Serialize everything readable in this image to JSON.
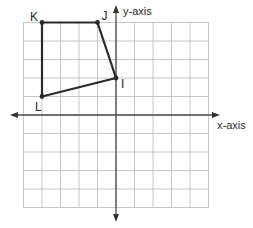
{
  "diagram": {
    "type": "coordinate-plane",
    "grid": {
      "x_min": -5,
      "x_max": 5,
      "y_min": -5,
      "y_max": 5,
      "step": 1
    },
    "axes": {
      "x_label": "x-axis",
      "y_label": "y-axis"
    },
    "polygon": {
      "vertices": [
        {
          "name": "K",
          "x": -4,
          "y": 5
        },
        {
          "name": "J",
          "x": -1,
          "y": 5
        },
        {
          "name": "I",
          "x": 0,
          "y": 2
        },
        {
          "name": "L",
          "x": -4,
          "y": 1
        }
      ],
      "edges": [
        [
          "K",
          "J"
        ],
        [
          "J",
          "I"
        ],
        [
          "I",
          "L"
        ],
        [
          "L",
          "K"
        ]
      ]
    },
    "colors": {
      "grid": "#b8b8b8",
      "axis": "#4a4a4a",
      "polygon": "#2a2a2a",
      "label": "#2a2a2a"
    }
  }
}
